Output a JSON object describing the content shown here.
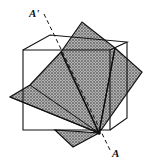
{
  "figure": {
    "labels": {
      "top_axis": "A'",
      "bottom_axis": "A"
    },
    "colors": {
      "ink": "#111111",
      "shade": "#9a9a9a",
      "paper": "#ffffff"
    }
  }
}
